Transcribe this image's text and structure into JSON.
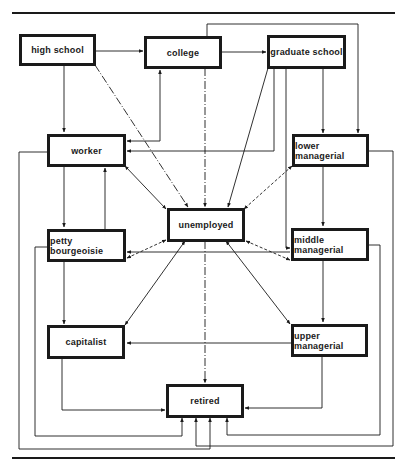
{
  "diagram": {
    "type": "flow-diagram",
    "nodes": {
      "high_school": "high school",
      "college": "college",
      "graduate_school": "graduate school",
      "worker": "worker",
      "lower_managerial": "lower managerial",
      "unemployed": "unemployed",
      "petty_bourgeoisie": "petty bourgeoisie",
      "middle_managerial": "middle managerial",
      "capitalist": "capitalist",
      "upper_managerial": "upper managerial",
      "retired": "retired"
    },
    "edges": [
      {
        "from": "high school",
        "to": "college",
        "style": "solid"
      },
      {
        "from": "high school",
        "to": "worker",
        "style": "solid"
      },
      {
        "from": "high school",
        "to": "unemployed",
        "style": "dash-dot"
      },
      {
        "from": "college",
        "to": "graduate school",
        "style": "solid"
      },
      {
        "from": "college",
        "to": "worker",
        "style": "solid",
        "bidirectional": true
      },
      {
        "from": "college",
        "to": "unemployed",
        "style": "dash-dot"
      },
      {
        "from": "college",
        "to": "lower managerial",
        "style": "solid"
      },
      {
        "from": "graduate school",
        "to": "lower managerial",
        "style": "solid"
      },
      {
        "from": "graduate school",
        "to": "worker",
        "style": "solid"
      },
      {
        "from": "graduate school",
        "to": "unemployed",
        "style": "solid"
      },
      {
        "from": "graduate school",
        "to": "middle managerial",
        "style": "solid"
      },
      {
        "from": "worker",
        "to": "unemployed",
        "style": "solid",
        "bidirectional": true
      },
      {
        "from": "worker",
        "to": "petty bourgeoisie",
        "style": "solid",
        "bidirectional": true
      },
      {
        "from": "worker",
        "to": "retired",
        "style": "solid"
      },
      {
        "from": "lower managerial",
        "to": "unemployed",
        "style": "dashed",
        "bidirectional": true
      },
      {
        "from": "lower managerial",
        "to": "middle managerial",
        "style": "solid"
      },
      {
        "from": "lower managerial",
        "to": "retired",
        "style": "solid"
      },
      {
        "from": "petty bourgeoisie",
        "to": "unemployed",
        "style": "dashed",
        "bidirectional": true
      },
      {
        "from": "petty bourgeoisie",
        "to": "capitalist",
        "style": "solid"
      },
      {
        "from": "petty bourgeoisie",
        "to": "retired",
        "style": "solid"
      },
      {
        "from": "middle managerial",
        "to": "unemployed",
        "style": "dashed",
        "bidirectional": true
      },
      {
        "from": "middle managerial",
        "to": "petty bourgeoisie",
        "style": "solid"
      },
      {
        "from": "middle managerial",
        "to": "upper managerial",
        "style": "solid"
      },
      {
        "from": "middle managerial",
        "to": "retired",
        "style": "solid"
      },
      {
        "from": "unemployed",
        "to": "capitalist",
        "style": "solid",
        "bidirectional": true
      },
      {
        "from": "unemployed",
        "to": "upper managerial",
        "style": "solid",
        "bidirectional": true
      },
      {
        "from": "unemployed",
        "to": "retired",
        "style": "dash-dot"
      },
      {
        "from": "upper managerial",
        "to": "capitalist",
        "style": "solid"
      },
      {
        "from": "upper managerial",
        "to": "retired",
        "style": "solid"
      },
      {
        "from": "capitalist",
        "to": "retired",
        "style": "solid"
      }
    ],
    "colors": {
      "ink": "#1a1a1a",
      "paper": "#ffffff"
    }
  }
}
